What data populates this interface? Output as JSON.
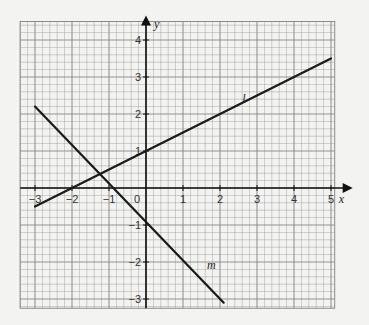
{
  "chart_data": {
    "type": "line",
    "title": "",
    "xlabel": "x",
    "ylabel": "y",
    "xlim": [
      -3.4,
      5.1
    ],
    "ylim": [
      -3.25,
      4.5
    ],
    "grid": true,
    "grid_minor_step": 0.2,
    "x_ticks": [
      -3,
      -2,
      -1,
      0,
      1,
      2,
      3,
      4,
      5
    ],
    "x_tick_labels": [
      "−3",
      "−2",
      "−1",
      "0",
      "1",
      "2",
      "3",
      "4",
      "5"
    ],
    "y_ticks": [
      -3,
      -2,
      -1,
      1,
      2,
      3,
      4
    ],
    "y_tick_labels": [
      "−3",
      "−2",
      "−1",
      "1",
      "2",
      "3",
      "4"
    ],
    "series": [
      {
        "name": "l",
        "equation": "y = 0.5x + 1",
        "x": [
          -3,
          5
        ],
        "y": [
          -0.5,
          3.5
        ],
        "label_at": [
          2.6,
          2.3
        ]
      },
      {
        "name": "m",
        "equation": "y = -x - 1",
        "x": [
          -3,
          2.1
        ],
        "y": [
          2.2,
          -3.1
        ],
        "label_at": [
          1.65,
          -2.2
        ]
      }
    ],
    "colors": {
      "background": "#f3f3f1",
      "grid": "#8a8a8a",
      "line": "#1a1a1a"
    }
  }
}
